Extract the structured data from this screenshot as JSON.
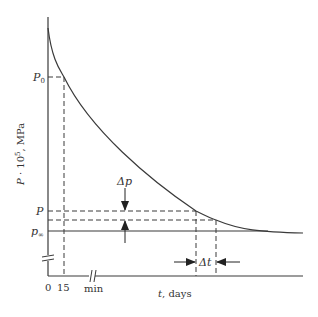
{
  "diagram": {
    "y_axis_label_var": "P",
    "y_axis_label_rest": " · 10",
    "y_axis_label_exp": "5",
    "y_axis_label_unit": ", MPa",
    "x_axis_label_var": "t",
    "x_axis_label_unit": ", days",
    "y_labels": {
      "p0_main": "P",
      "p0_sub": "0",
      "p": "P",
      "pinf_main": "p",
      "pinf_sub": "∞"
    },
    "x_ticks": {
      "zero": "0",
      "fifteen": "15",
      "min": "min"
    },
    "annotations": {
      "delta_p": "Δp",
      "delta_t": "Δt"
    },
    "colors": {
      "line": "#3a3a3a",
      "background": "#ffffff"
    }
  }
}
